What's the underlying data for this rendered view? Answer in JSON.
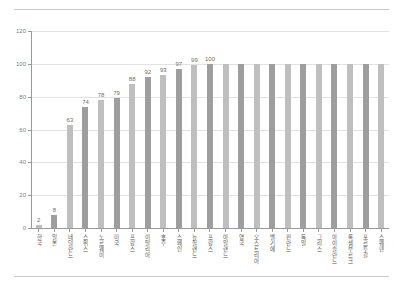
{
  "chart_data": {
    "type": "bar",
    "title": "",
    "subtitle": "",
    "xlabel": "",
    "ylabel": "",
    "ylim": [
      0,
      120
    ],
    "ytick_values": [
      0,
      20,
      40,
      60,
      80,
      100,
      120
    ],
    "ytick_labels": [
      "0",
      "20",
      "40",
      "60",
      "80",
      "100",
      "120"
    ],
    "grid": true,
    "grid_axis": "y",
    "legend": false,
    "legend_position": "none",
    "orientation": "vertical",
    "bar_colors": {
      "light": "#bfbfbf",
      "dark": "#9e9e9e"
    },
    "categories": [
      "한국",
      "일본",
      "네덜란드",
      "스위스",
      "노르웨이",
      "미국",
      "프랑스",
      "이탈리아",
      "호주",
      "스페인",
      "뉴질랜드",
      "프랑스",
      "아일랜드",
      "영국",
      "오스트리아",
      "벨기에",
      "핀란드",
      "독일",
      "그리스",
      "아이슬란드",
      "룩셈부르크",
      "포르투갈",
      "스웨덴"
    ],
    "values": [
      2,
      8,
      63,
      74,
      78,
      79,
      88,
      92,
      93,
      97,
      99,
      100,
      100,
      100,
      100,
      100,
      100,
      100,
      100,
      100,
      100,
      100,
      100
    ],
    "value_labels": [
      "2",
      "8",
      "63",
      "74",
      "78",
      "79",
      "88",
      "92",
      "93",
      "97",
      "99",
      "100",
      "",
      "",
      "",
      "",
      "",
      "",
      "",
      "",
      "",
      "",
      ""
    ]
  }
}
